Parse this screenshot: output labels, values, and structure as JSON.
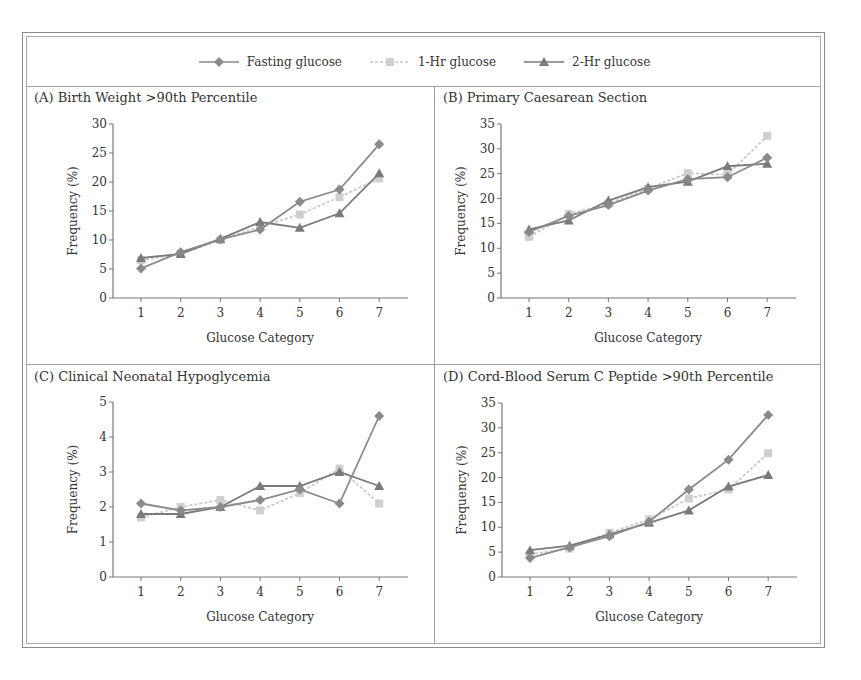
{
  "legend": {
    "items": [
      {
        "label": "Fasting glucose",
        "marker": "diamond",
        "color": "#8a8a8a",
        "dash": "none"
      },
      {
        "label": "1-Hr glucose",
        "marker": "square",
        "color": "#c8c8c8",
        "dash": "3,2"
      },
      {
        "label": "2-Hr glucose",
        "marker": "triangle",
        "color": "#7a7a7a",
        "dash": "none"
      }
    ]
  },
  "panels": [
    {
      "title": "(A) Birth Weight >90th Percentile"
    },
    {
      "title": "(B) Primary Caesarean Section"
    },
    {
      "title": "(C) Clinical Neonatal Hypoglycemia"
    },
    {
      "title": "(D) Cord-Blood Serum C Peptide >90th Percentile"
    }
  ],
  "chart_data": [
    {
      "type": "line",
      "title": "(A) Birth Weight >90th Percentile",
      "xlabel": "Glucose Category",
      "ylabel": "Frequency (%)",
      "categories": [
        1,
        2,
        3,
        4,
        5,
        6,
        7
      ],
      "ylim": [
        0,
        30
      ],
      "yticks": [
        0,
        5,
        10,
        15,
        20,
        25,
        30
      ],
      "grid": false,
      "legend_position": "top",
      "series": [
        {
          "name": "Fasting glucose",
          "values": [
            5.1,
            7.9,
            10.1,
            11.8,
            16.6,
            18.7,
            26.5
          ]
        },
        {
          "name": "1-Hr glucose",
          "values": [
            6.5,
            7.6,
            10.0,
            12.3,
            14.4,
            17.4,
            20.6
          ]
        },
        {
          "name": "2-Hr glucose",
          "values": [
            6.9,
            7.6,
            10.2,
            13.1,
            12.1,
            14.6,
            21.5
          ]
        }
      ]
    },
    {
      "type": "line",
      "title": "(B) Primary Caesarean Section",
      "xlabel": "Glucose Category",
      "ylabel": "Frequency (%)",
      "categories": [
        1,
        2,
        3,
        4,
        5,
        6,
        7
      ],
      "ylim": [
        0,
        35
      ],
      "yticks": [
        0,
        5,
        10,
        15,
        20,
        25,
        30,
        35
      ],
      "grid": false,
      "legend_position": "top",
      "series": [
        {
          "name": "Fasting glucose",
          "values": [
            13.3,
            16.5,
            18.7,
            21.6,
            23.9,
            24.3,
            28.2
          ]
        },
        {
          "name": "1-Hr glucose",
          "values": [
            12.3,
            16.9,
            19.0,
            22.0,
            25.1,
            24.8,
            32.6
          ]
        },
        {
          "name": "2-Hr glucose",
          "values": [
            13.8,
            15.6,
            19.6,
            22.3,
            23.4,
            26.5,
            27.0
          ]
        }
      ]
    },
    {
      "type": "line",
      "title": "(C) Clinical Neonatal Hypoglycemia",
      "xlabel": "Glucose Category",
      "ylabel": "Frequency (%)",
      "categories": [
        1,
        2,
        3,
        4,
        5,
        6,
        7
      ],
      "ylim": [
        0,
        5
      ],
      "yticks": [
        0,
        1,
        2,
        3,
        4,
        5
      ],
      "grid": false,
      "legend_position": "top",
      "series": [
        {
          "name": "Fasting glucose",
          "values": [
            2.1,
            1.9,
            2.0,
            2.2,
            2.5,
            2.1,
            4.6
          ]
        },
        {
          "name": "1-Hr glucose",
          "values": [
            1.7,
            2.0,
            2.2,
            1.9,
            2.4,
            3.1,
            2.1
          ]
        },
        {
          "name": "2-Hr glucose",
          "values": [
            1.8,
            1.8,
            2.0,
            2.6,
            2.6,
            3.0,
            2.6
          ]
        }
      ]
    },
    {
      "type": "line",
      "title": "(D) Cord-Blood Serum C Peptide >90th Percentile",
      "xlabel": "Glucose Category",
      "ylabel": "Frequency (%)",
      "categories": [
        1,
        2,
        3,
        4,
        5,
        6,
        7
      ],
      "ylim": [
        0,
        35
      ],
      "yticks": [
        0,
        5,
        10,
        15,
        20,
        25,
        30,
        35
      ],
      "grid": false,
      "legend_position": "top",
      "series": [
        {
          "name": "Fasting glucose",
          "values": [
            3.8,
            6.0,
            8.2,
            11.1,
            17.6,
            23.6,
            32.6
          ]
        },
        {
          "name": "1-Hr glucose",
          "values": [
            4.6,
            5.7,
            8.9,
            11.6,
            15.8,
            17.6,
            24.9
          ]
        },
        {
          "name": "2-Hr glucose",
          "values": [
            5.4,
            6.3,
            8.6,
            10.9,
            13.4,
            18.2,
            20.5
          ]
        }
      ]
    }
  ]
}
